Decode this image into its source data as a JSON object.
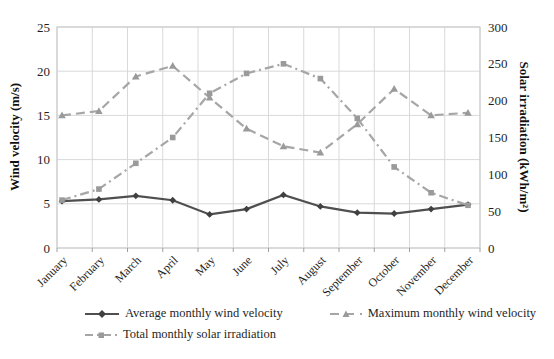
{
  "chart_data": {
    "type": "line",
    "title": "",
    "categories": [
      "January",
      "February",
      "March",
      "April",
      "May",
      "June",
      "July",
      "August",
      "September",
      "October",
      "November",
      "December"
    ],
    "series": [
      {
        "name": "Average monthly wind velocity",
        "axis": "left",
        "marker": "diamond",
        "line_style": "solid",
        "color": "#4f4f4f",
        "marker_color": "#404040",
        "values": [
          5.3,
          5.5,
          5.9,
          5.4,
          3.8,
          4.4,
          6.0,
          4.7,
          4.0,
          3.9,
          4.4,
          4.9
        ]
      },
      {
        "name": "Maximum monthly wind velocity",
        "axis": "left",
        "marker": "triangle",
        "line_style": "dashed",
        "color": "#a6a6a6",
        "marker_color": "#9a9a9a",
        "values": [
          15.0,
          15.5,
          19.4,
          20.6,
          17.0,
          13.5,
          11.5,
          10.8,
          14.0,
          18.0,
          15.0,
          15.3
        ]
      },
      {
        "name": "Total monthly solar irradiation",
        "axis": "right",
        "marker": "square",
        "line_style": "dashdot",
        "color": "#a6a6a6",
        "marker_color": "#9a9a9a",
        "values": [
          65,
          80,
          115,
          150,
          210,
          237,
          250,
          230,
          176,
          110,
          75,
          58
        ]
      }
    ],
    "left_axis": {
      "label": "Wind velocity (m/s)",
      "min": 0,
      "max": 25,
      "ticks": [
        0,
        5,
        10,
        15,
        20,
        25
      ]
    },
    "right_axis": {
      "label": "Solar irradiation (kWh/m²)",
      "min": 0,
      "max": 300,
      "ticks": [
        0,
        50,
        100,
        150,
        200,
        250,
        300
      ]
    },
    "grid": true,
    "legend_position": "bottom"
  },
  "colors": {
    "gridline": "#d9d9d9",
    "plot_border": "#c8c8c8",
    "tick_mark": "#a0a0a0",
    "tick_text": "#1f1f1f"
  }
}
